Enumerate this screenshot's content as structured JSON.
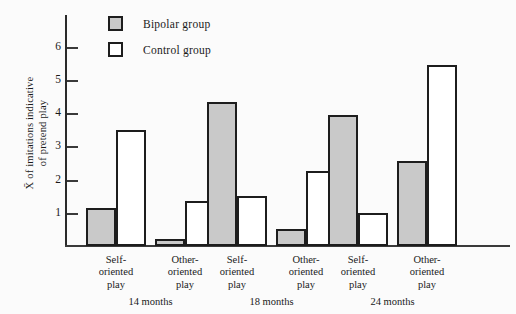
{
  "chart_data": {
    "type": "bar",
    "title": "",
    "xlabel": "",
    "ylabel": "X̄ of imitations indicative of pretend play",
    "ylabel_line1": "X̄ of imitations indicative",
    "ylabel_line2": "of pretend play",
    "ylim": [
      0,
      6.6
    ],
    "yticks": [
      1,
      2,
      3,
      4,
      5,
      6
    ],
    "ytick_labels": [
      "1",
      "2",
      "3",
      "4",
      "5",
      "6"
    ],
    "grid": false,
    "legend_position": "top-center",
    "categories": [
      "Self-oriented play",
      "Other-oriented play",
      "Self-oriented play",
      "Other-oriented play",
      "Self-oriented play",
      "Other-oriented play"
    ],
    "category_lines": [
      [
        "Self-",
        "oriented",
        "play"
      ],
      [
        "Other-",
        "oriented",
        "play"
      ],
      [
        "Self-",
        "oriented",
        "play"
      ],
      [
        "Other-",
        "oriented",
        "play"
      ],
      [
        "Self-",
        "oriented",
        "play"
      ],
      [
        "Other-",
        "oriented",
        "play"
      ]
    ],
    "groups": [
      "14 months",
      "18 months",
      "24 months"
    ],
    "series": [
      {
        "name": "Bipolar group",
        "color": "#c9c9c9",
        "values": [
          1.15,
          0.2,
          4.35,
          0.5,
          3.95,
          2.55
        ]
      },
      {
        "name": "Control group",
        "color": "#ffffff",
        "values": [
          3.5,
          1.35,
          1.5,
          2.25,
          1.0,
          5.45
        ]
      }
    ]
  },
  "legend": {
    "items": [
      {
        "label": "Bipolar group",
        "style": "filled"
      },
      {
        "label": "Control group",
        "style": "open"
      }
    ]
  },
  "colors": {
    "bar_fill_bipolar": "#c9c9c9",
    "bar_fill_control": "#ffffff",
    "bar_stroke": "#1d1d1d",
    "axis": "#3a3a3a",
    "background": "#fbfbfb"
  }
}
